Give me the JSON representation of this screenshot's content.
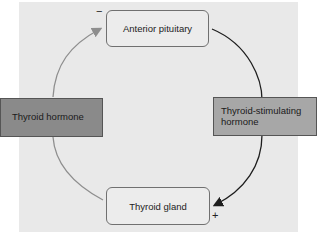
{
  "nodes": {
    "top": "Anterior pituitary",
    "bottom": "Thyroid gland"
  },
  "labels": {
    "left": "Thyroid hormone",
    "right": "Thyroid-stimulating hormone"
  },
  "signs": {
    "inhibit": "−",
    "stimulate": "+"
  },
  "colors": {
    "left_label_bg": "#8a8a8a",
    "right_label_bg": "#a7a7a7",
    "left_arrow": "#8e8e8e",
    "right_arrow": "#1e1e1e"
  }
}
